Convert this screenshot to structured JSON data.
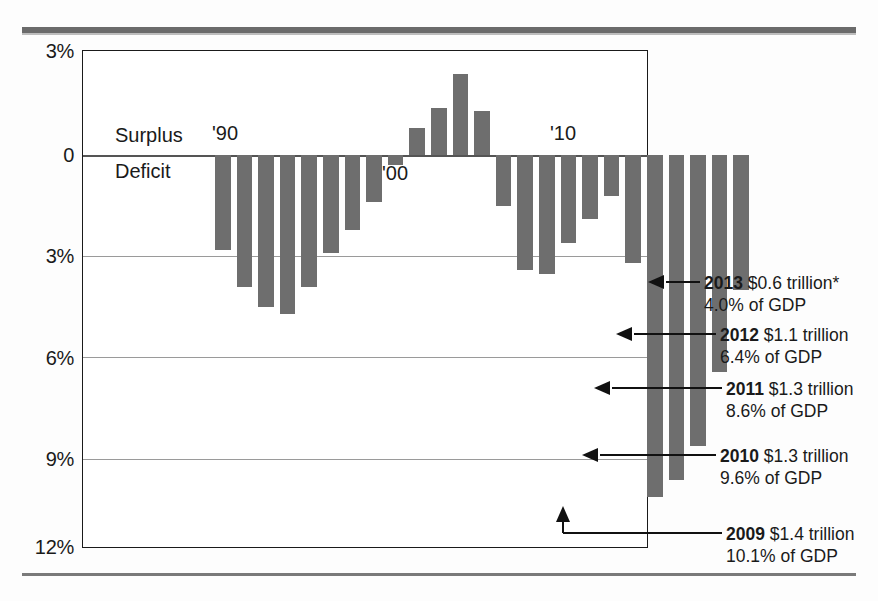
{
  "chart_data": {
    "type": "bar",
    "title": "",
    "subtitle": "",
    "xlabel": "",
    "ylabel": "",
    "orientation": "vertical",
    "grid": true,
    "legend": false,
    "note": "Federal budget surplus or deficit as a percent of GDP. Bars below the zero line are deficits, bars above are surpluses.",
    "y_axis": {
      "ticks": [
        "3%",
        "0",
        "3%",
        "6%",
        "9%",
        "12%"
      ],
      "tick_values": [
        3,
        0,
        -3,
        -6,
        -9,
        -12
      ],
      "ylim": [
        -12,
        3
      ],
      "inverted_sign_labels": true
    },
    "x_axis": {
      "tick_labels": [
        "'90",
        "'00",
        "'10"
      ],
      "tick_years": [
        1990,
        2000,
        2010
      ]
    },
    "axis_region_labels": {
      "above_zero": "Surplus",
      "below_zero": "Deficit"
    },
    "categories": [
      1989,
      1990,
      1991,
      1992,
      1993,
      1994,
      1995,
      1996,
      1997,
      1998,
      1999,
      2000,
      2001,
      2002,
      2003,
      2004,
      2005,
      2006,
      2007,
      2008,
      2009,
      2010,
      2011,
      2012,
      2013
    ],
    "values": [
      -2.8,
      -3.9,
      -4.5,
      -4.7,
      -3.9,
      -2.9,
      -2.2,
      -1.4,
      -0.3,
      0.8,
      1.4,
      2.4,
      1.3,
      -1.5,
      -3.4,
      -3.5,
      -2.6,
      -1.9,
      -1.2,
      -3.2,
      -10.1,
      -9.6,
      -8.6,
      -6.4,
      -4.0
    ],
    "bar_color": "#6e6e6e",
    "annotations": [
      {
        "year": "2013",
        "amount": "$0.6 trillion*",
        "pct_line": "4.0% of GDP",
        "value": -4.0
      },
      {
        "year": "2012",
        "amount": "$1.1 trillion",
        "pct_line": "6.4% of GDP",
        "value": -6.4
      },
      {
        "year": "2011",
        "amount": "$1.3 trillion",
        "pct_line": "8.6% of GDP",
        "value": -8.6
      },
      {
        "year": "2010",
        "amount": "$1.3 trillion",
        "pct_line": "9.6% of GDP",
        "value": -9.6
      },
      {
        "year": "2009",
        "amount": "$1.4 trillion",
        "pct_line": "10.1% of GDP",
        "value": -10.1
      }
    ]
  },
  "yticks": {
    "t0": "3%",
    "t1": "0",
    "t2": "3%",
    "t3": "6%",
    "t4": "9%",
    "t5": "12%"
  },
  "labels": {
    "surplus": "Surplus",
    "deficit": "Deficit",
    "x90": "'90",
    "x00": "'00",
    "x10": "'10"
  },
  "annotations": {
    "a2013": {
      "year": "2013",
      "amount": "$0.6 trillion*",
      "pct": "4.0% of GDP"
    },
    "a2012": {
      "year": "2012",
      "amount": "$1.1 trillion",
      "pct": "6.4% of GDP"
    },
    "a2011": {
      "year": "2011",
      "amount": "$1.3 trillion",
      "pct": "8.6% of GDP"
    },
    "a2010": {
      "year": "2010",
      "amount": "$1.3 trillion",
      "pct": "9.6% of GDP"
    },
    "a2009": {
      "year": "2009",
      "amount": "$1.4 trillion",
      "pct": "10.1% of GDP"
    }
  },
  "colors": {
    "bar": "#6e6e6e",
    "frame": "#1a1a1a",
    "grid": "#9a9a9a",
    "rule": "#6b6b6b"
  }
}
